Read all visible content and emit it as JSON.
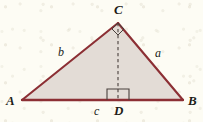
{
  "figure": {
    "kind": "geometry-diagram",
    "colors": {
      "page_background": "#fdfcf4",
      "triangle_fill": "#e3dcd6",
      "triangle_stroke": "#8c2f34",
      "altitude_stroke": "#4a403c",
      "right_angle_stroke": "#4a403c",
      "label_color": "#211c18"
    },
    "geometry": {
      "vertices": {
        "A": {
          "x": 22,
          "y": 100
        },
        "B": {
          "x": 183,
          "y": 100
        },
        "C": {
          "x": 118,
          "y": 23
        },
        "D": {
          "x": 118,
          "y": 100
        }
      },
      "altitude": {
        "from": "C",
        "to": "D",
        "style": "dashed"
      },
      "right_angles": [
        {
          "at": "D",
          "between": [
            "DC",
            "DB"
          ],
          "marker": "square"
        },
        {
          "at": "C",
          "between": [
            "CA",
            "CD"
          ],
          "marker": "square"
        }
      ]
    },
    "vertex_labels": [
      {
        "id": "A",
        "text": "A"
      },
      {
        "id": "B",
        "text": "B"
      },
      {
        "id": "C",
        "text": "C"
      },
      {
        "id": "D",
        "text": "D"
      }
    ],
    "side_labels": [
      {
        "id": "a",
        "text": "a",
        "side": "CB"
      },
      {
        "id": "b",
        "text": "b",
        "side": "AC"
      },
      {
        "id": "c",
        "text": "c",
        "side": "AB"
      }
    ]
  }
}
